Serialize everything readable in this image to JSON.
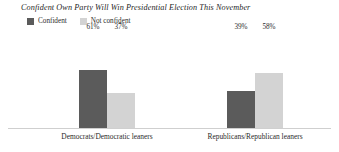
{
  "chart_data": {
    "type": "bar",
    "title": "Confident Own Party Will Win Presidential Election This November",
    "xlabel": "",
    "ylabel": "",
    "ylim": [
      0,
      100
    ],
    "grid": false,
    "legend_position": "top-left",
    "value_suffix": "%",
    "categories": [
      "Democrats/Democratic leaners",
      "Republicans/Republican leaners"
    ],
    "series": [
      {
        "name": "Confident",
        "color": "#5b5b5b",
        "values": [
          61,
          37
        ],
        "labels": [
          "61%",
          "37%"
        ]
      },
      {
        "name": "Not confident",
        "color": "#d3d3d3",
        "values": [
          39,
          58
        ],
        "labels": [
          "39%",
          "58%"
        ]
      }
    ],
    "groups": [
      {
        "category": "Democrats/Democratic leaners",
        "bars": [
          {
            "series": "Confident",
            "value": 61,
            "label": "61%",
            "color": "#5b5b5b"
          },
          {
            "series": "Not confident",
            "value": 37,
            "label": "37%",
            "color": "#d3d3d3"
          }
        ]
      },
      {
        "category": "Republicans/Republican leaners",
        "bars": [
          {
            "series": "Confident",
            "value": 39,
            "label": "39%",
            "color": "#5b5b5b"
          },
          {
            "series": "Not confident",
            "value": 58,
            "label": "58%",
            "color": "#d3d3d3"
          }
        ]
      }
    ]
  },
  "legend": {
    "items": [
      {
        "label": "Confident",
        "color": "#5b5b5b"
      },
      {
        "label": "Not confident",
        "color": "#d3d3d3"
      }
    ]
  },
  "colors": {
    "confident": "#5b5b5b",
    "not_confident": "#d3d3d3",
    "baseline": "#cfcfcf",
    "text": "#2b2b2b",
    "background": "#ffffff"
  }
}
